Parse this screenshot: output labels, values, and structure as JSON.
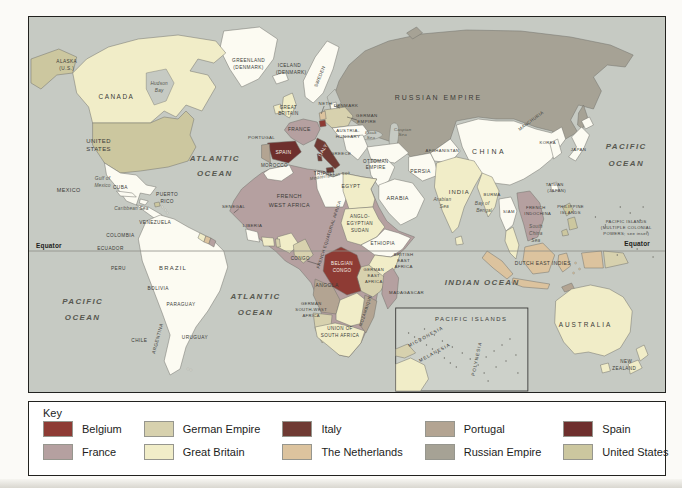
{
  "colors": {
    "ocean": "#c6cac3",
    "land": "#fcfbf2",
    "gb": "#f1edc8",
    "fr": "#b5a0a0",
    "de": "#d7d1ae",
    "nl": "#dcc39e",
    "pt": "#b3a492",
    "ru": "#a6a295",
    "us": "#ccc79f",
    "be": "#8e3b34",
    "it": "#6f3a33",
    "es": "#6e2f2d",
    "inset_bg": "#cdd1ca"
  },
  "legend": {
    "title": "Key",
    "entries": [
      {
        "label": "Belgium",
        "color": "#8e3b34"
      },
      {
        "label": "France",
        "color": "#b5a0a0"
      },
      {
        "label": "German Empire",
        "color": "#d7d1ae"
      },
      {
        "label": "Great Britain",
        "color": "#f1edc8"
      },
      {
        "label": "Italy",
        "color": "#6f3a33"
      },
      {
        "label": "The Netherlands",
        "color": "#dcc39e"
      },
      {
        "label": "Portugal",
        "color": "#b3a492"
      },
      {
        "label": "Russian Empire",
        "color": "#a6a295"
      },
      {
        "label": "Spain",
        "color": "#6e2f2d"
      },
      {
        "label": "United States",
        "color": "#ccc79f"
      },
      {
        "label": "Other independent states",
        "color": "#ffffff"
      }
    ]
  },
  "map": {
    "labels": [
      {
        "t": "ALASKA",
        "x": 38,
        "y": 46,
        "c": "country",
        "s": 4.8
      },
      {
        "t": "(U.S.)",
        "x": 38,
        "y": 53,
        "c": "country",
        "s": 4.8
      },
      {
        "t": "CANADA",
        "x": 88,
        "y": 82,
        "c": "country",
        "s": 6.5,
        "ls": 1.5
      },
      {
        "t": "Hudson",
        "x": 131,
        "y": 68,
        "c": "sea"
      },
      {
        "t": "Bay",
        "x": 131,
        "y": 75,
        "c": "sea"
      },
      {
        "t": "GREENLAND",
        "x": 221,
        "y": 45,
        "c": "country",
        "s": 4.8
      },
      {
        "t": "(DENMARK)",
        "x": 221,
        "y": 52,
        "c": "country",
        "s": 4.8
      },
      {
        "t": "ICELAND",
        "x": 262,
        "y": 50,
        "c": "country",
        "s": 4.8
      },
      {
        "t": "(DENMARK)",
        "x": 264,
        "y": 57,
        "c": "country",
        "s": 4.8
      },
      {
        "t": "UNITED",
        "x": 70,
        "y": 126,
        "c": "country",
        "s": 6
      },
      {
        "t": "STATES",
        "x": 70,
        "y": 134,
        "c": "country",
        "s": 6
      },
      {
        "t": "Gulf of",
        "x": 74,
        "y": 163,
        "c": "sea"
      },
      {
        "t": "Mexico",
        "x": 74,
        "y": 170,
        "c": "sea"
      },
      {
        "t": "MEXICO",
        "x": 40,
        "y": 175,
        "c": "country"
      },
      {
        "t": "CUBA",
        "x": 92,
        "y": 172,
        "c": "country",
        "s": 4.8
      },
      {
        "t": "PUERTO",
        "x": 139,
        "y": 179,
        "c": "country",
        "s": 4.8
      },
      {
        "t": "RICO",
        "x": 139,
        "y": 186,
        "c": "country",
        "s": 4.8
      },
      {
        "t": "Caribbean Sea",
        "x": 103,
        "y": 193,
        "c": "sea"
      },
      {
        "t": "VENEZUELA",
        "x": 127,
        "y": 207,
        "c": "country",
        "s": 4.8
      },
      {
        "t": "COLOMBIA",
        "x": 92,
        "y": 220,
        "c": "country",
        "s": 4.8
      },
      {
        "t": "ECUADOR",
        "x": 82,
        "y": 233,
        "c": "country",
        "s": 4.8
      },
      {
        "t": "PERU",
        "x": 90,
        "y": 253,
        "c": "country",
        "s": 4.8
      },
      {
        "t": "BRAZIL",
        "x": 145,
        "y": 253,
        "c": "country",
        "s": 6,
        "ls": 1.2
      },
      {
        "t": "BOLIVIA",
        "x": 130,
        "y": 273,
        "c": "country",
        "s": 4.8
      },
      {
        "t": "PARAGUAY",
        "x": 153,
        "y": 289,
        "c": "country",
        "s": 4.8
      },
      {
        "t": "ARGENTINA",
        "x": 131,
        "y": 322,
        "c": "country",
        "s": 4.8,
        "r": -75
      },
      {
        "t": "CHILE",
        "x": 111,
        "y": 325,
        "c": "country",
        "s": 4.8
      },
      {
        "t": "URUGUAY",
        "x": 167,
        "y": 322,
        "c": "country",
        "s": 4.8
      },
      {
        "t": "ATLANTIC",
        "x": 187,
        "y": 144,
        "c": "ocean"
      },
      {
        "t": "OCEAN",
        "x": 187,
        "y": 159,
        "c": "ocean"
      },
      {
        "t": "PACIFIC",
        "x": 54,
        "y": 287,
        "c": "ocean"
      },
      {
        "t": "OCEAN",
        "x": 54,
        "y": 303,
        "c": "ocean"
      },
      {
        "t": "ATLANTIC",
        "x": 228,
        "y": 282,
        "c": "ocean"
      },
      {
        "t": "OCEAN",
        "x": 228,
        "y": 298,
        "c": "ocean"
      },
      {
        "t": "INDIAN OCEAN",
        "x": 456,
        "y": 268,
        "c": "ocean"
      },
      {
        "t": "PACIFIC",
        "x": 601,
        "y": 132,
        "c": "ocean"
      },
      {
        "t": "OCEAN",
        "x": 601,
        "y": 149,
        "c": "ocean"
      },
      {
        "t": "SWEDEN",
        "x": 294,
        "y": 60,
        "c": "country",
        "s": 4.6,
        "r": -68
      },
      {
        "t": "NETH.",
        "x": 299,
        "y": 88,
        "c": "country",
        "s": 4.4
      },
      {
        "t": "DENMARK",
        "x": 319,
        "y": 90,
        "c": "country",
        "s": 4.4
      },
      {
        "t": "GREAT",
        "x": 261,
        "y": 92,
        "c": "country",
        "s": 4.6
      },
      {
        "t": "BRITAIN",
        "x": 261,
        "y": 98,
        "c": "country",
        "s": 4.6
      },
      {
        "t": "FRANCE",
        "x": 272,
        "y": 114,
        "c": "country",
        "s": 5
      },
      {
        "t": "GERMAN",
        "x": 340,
        "y": 100,
        "c": "country",
        "s": 4.4
      },
      {
        "t": "EMPIRE",
        "x": 340,
        "y": 106,
        "c": "country",
        "s": 4.4
      },
      {
        "t": "AUSTRIA-",
        "x": 321,
        "y": 115,
        "c": "country",
        "s": 4.4
      },
      {
        "t": "HUNGARY",
        "x": 321,
        "y": 121,
        "c": "country",
        "s": 4.4
      },
      {
        "t": "PORTUGAL",
        "x": 234,
        "y": 122,
        "c": "country",
        "s": 4.4
      },
      {
        "t": "SPAIN",
        "x": 256,
        "y": 137,
        "c": "white",
        "s": 5
      },
      {
        "t": "ITALY",
        "x": 297,
        "y": 134,
        "c": "white",
        "s": 4.8,
        "r": -60
      },
      {
        "t": "GREECE",
        "x": 314,
        "y": 138,
        "c": "country",
        "s": 4.4
      },
      {
        "t": "OTTOMAN",
        "x": 349,
        "y": 146,
        "c": "country",
        "s": 4.6
      },
      {
        "t": "EMPIRE",
        "x": 349,
        "y": 152,
        "c": "country",
        "s": 4.6
      },
      {
        "t": "RUSSIAN EMPIRE",
        "x": 412,
        "y": 83,
        "c": "country",
        "s": 7,
        "ls": 2
      },
      {
        "t": "Black",
        "x": 344,
        "y": 117,
        "c": "sea",
        "s": 4.4
      },
      {
        "t": "Sea",
        "x": 344,
        "y": 122,
        "c": "sea",
        "s": 4.4
      },
      {
        "t": "Caspian",
        "x": 376,
        "y": 114,
        "c": "sea",
        "s": 4.4
      },
      {
        "t": "Sea",
        "x": 376,
        "y": 119,
        "c": "sea",
        "s": 4.4
      },
      {
        "t": "Mediterranean Sea",
        "x": 303,
        "y": 160,
        "c": "sea",
        "s": 4.4,
        "r": -9
      },
      {
        "t": "MOROCCO",
        "x": 247,
        "y": 150,
        "c": "country",
        "s": 4.6
      },
      {
        "t": "TRIPOLI",
        "x": 297,
        "y": 158,
        "c": "country",
        "s": 4.6
      },
      {
        "t": "EGYPT",
        "x": 324,
        "y": 171,
        "c": "country",
        "s": 5
      },
      {
        "t": "SENEGAL",
        "x": 206,
        "y": 191,
        "c": "country",
        "s": 4.4
      },
      {
        "t": "FRENCH",
        "x": 262,
        "y": 181,
        "c": "country",
        "s": 5.5
      },
      {
        "t": "WEST AFRICA",
        "x": 262,
        "y": 190,
        "c": "country",
        "s": 5.5
      },
      {
        "t": "LIBERIA",
        "x": 225,
        "y": 210,
        "c": "country",
        "s": 4.4
      },
      {
        "t": "FRENCH EQUATORIAL AFRICA",
        "x": 303,
        "y": 218,
        "c": "country",
        "s": 4.2,
        "r": -72
      },
      {
        "t": "ANGLO-",
        "x": 333,
        "y": 201,
        "c": "country",
        "s": 4.6
      },
      {
        "t": "EGYPTIAN",
        "x": 333,
        "y": 208,
        "c": "country",
        "s": 4.6
      },
      {
        "t": "SUDAN",
        "x": 333,
        "y": 215,
        "c": "country",
        "s": 4.6
      },
      {
        "t": "ETHIOPIA",
        "x": 356,
        "y": 228,
        "c": "country",
        "s": 4.6
      },
      {
        "t": "CONGO",
        "x": 273,
        "y": 243,
        "c": "country",
        "s": 4.6
      },
      {
        "t": "BELGIAN",
        "x": 315,
        "y": 248,
        "c": "white",
        "s": 4.6
      },
      {
        "t": "CONGO",
        "x": 315,
        "y": 255,
        "c": "white",
        "s": 4.6
      },
      {
        "t": "BRITISH",
        "x": 377,
        "y": 239,
        "c": "country",
        "s": 4.4
      },
      {
        "t": "EAST",
        "x": 377,
        "y": 245,
        "c": "country",
        "s": 4.4
      },
      {
        "t": "AFRICA",
        "x": 377,
        "y": 251,
        "c": "country",
        "s": 4.4
      },
      {
        "t": "GERMAN",
        "x": 347,
        "y": 254,
        "c": "country",
        "s": 4.2
      },
      {
        "t": "EAST",
        "x": 347,
        "y": 260,
        "c": "country",
        "s": 4.2
      },
      {
        "t": "AFRICA",
        "x": 347,
        "y": 266,
        "c": "country",
        "s": 4.2
      },
      {
        "t": "ANGOLA",
        "x": 300,
        "y": 270,
        "c": "country",
        "s": 5
      },
      {
        "t": "GERMAN",
        "x": 284,
        "y": 288,
        "c": "country",
        "s": 4.2
      },
      {
        "t": "SOUTH-WEST",
        "x": 284,
        "y": 294,
        "c": "country",
        "s": 4.2
      },
      {
        "t": "AFRICA",
        "x": 284,
        "y": 300,
        "c": "country",
        "s": 4.2
      },
      {
        "t": "MOZAMBIQUE",
        "x": 340,
        "y": 294,
        "c": "country",
        "s": 4.2,
        "r": -72
      },
      {
        "t": "MADAGASCAR",
        "x": 380,
        "y": 277,
        "c": "country",
        "s": 4.4
      },
      {
        "t": "UNION OF",
        "x": 313,
        "y": 313,
        "c": "country",
        "s": 4.6
      },
      {
        "t": "SOUTH AFRICA",
        "x": 313,
        "y": 320,
        "c": "country",
        "s": 4.6
      },
      {
        "t": "PERSIA",
        "x": 394,
        "y": 156,
        "c": "country",
        "s": 5
      },
      {
        "t": "ARABIA",
        "x": 371,
        "y": 183,
        "c": "country",
        "s": 5.5
      },
      {
        "t": "AFGHANISTAN",
        "x": 416,
        "y": 135,
        "c": "country",
        "s": 4.2
      },
      {
        "t": "Arabian",
        "x": 416,
        "y": 184,
        "c": "sea"
      },
      {
        "t": "Sea",
        "x": 418,
        "y": 191,
        "c": "sea"
      },
      {
        "t": "CHINA",
        "x": 463,
        "y": 137,
        "c": "country",
        "s": 7,
        "ls": 2.5
      },
      {
        "t": "INDIA",
        "x": 433,
        "y": 177,
        "c": "country",
        "s": 6,
        "ls": 1
      },
      {
        "t": "Bay of",
        "x": 456,
        "y": 188,
        "c": "sea"
      },
      {
        "t": "Bengal",
        "x": 458,
        "y": 195,
        "c": "sea"
      },
      {
        "t": "BURMA",
        "x": 466,
        "y": 179,
        "c": "country",
        "s": 4.2
      },
      {
        "t": "SIAM",
        "x": 483,
        "y": 196,
        "c": "country",
        "s": 4.2
      },
      {
        "t": "FRENCH",
        "x": 510,
        "y": 192,
        "c": "country",
        "s": 4.2
      },
      {
        "t": "INDOCHINA",
        "x": 512,
        "y": 198,
        "c": "country",
        "s": 4.2
      },
      {
        "t": "TAIWAN",
        "x": 529,
        "y": 169,
        "c": "country",
        "s": 4.2
      },
      {
        "t": "(JAPAN)",
        "x": 531,
        "y": 175,
        "c": "country",
        "s": 4.2
      },
      {
        "t": "KOREA",
        "x": 522,
        "y": 127,
        "c": "country",
        "s": 4.2
      },
      {
        "t": "JAPAN",
        "x": 553,
        "y": 134,
        "c": "country",
        "s": 4.4
      },
      {
        "t": "MANCHURIA",
        "x": 506,
        "y": 105,
        "c": "country",
        "s": 4.4,
        "r": -36
      },
      {
        "t": "PHILIPPINE",
        "x": 545,
        "y": 191,
        "c": "country",
        "s": 4.2
      },
      {
        "t": "ISLANDS",
        "x": 545,
        "y": 197,
        "c": "country",
        "s": 4.2
      },
      {
        "t": "South",
        "x": 510,
        "y": 211,
        "c": "sea"
      },
      {
        "t": "China",
        "x": 510,
        "y": 218,
        "c": "sea"
      },
      {
        "t": "Sea",
        "x": 510,
        "y": 225,
        "c": "sea"
      },
      {
        "t": "DUTCH EAST INDIES",
        "x": 517,
        "y": 248,
        "c": "country",
        "s": 5
      },
      {
        "t": "PACIFIC ISLANDS",
        "x": 601,
        "y": 206,
        "c": "country",
        "s": 4.2
      },
      {
        "t": "(MULTIPLE COLONIAL",
        "x": 601,
        "y": 212,
        "c": "country",
        "s": 4.2
      },
      {
        "t": "POWERS; see inset)",
        "x": 601,
        "y": 218,
        "c": "country",
        "s": 4.2
      },
      {
        "t": "AUSTRALIA",
        "x": 560,
        "y": 310,
        "c": "country",
        "s": 6.5,
        "ls": 2
      },
      {
        "t": "NEW",
        "x": 601,
        "y": 346,
        "c": "country",
        "s": 4.6
      },
      {
        "t": "ZEALAND",
        "x": 599,
        "y": 353,
        "c": "country",
        "s": 4.6
      },
      {
        "t": "Equator",
        "x": 20,
        "y": 231,
        "c": "bold",
        "a": "start"
      },
      {
        "t": "Equator",
        "x": 612,
        "y": 229,
        "c": "bold"
      },
      {
        "t": "PACIFIC ISLANDS",
        "x": 445,
        "y": 304,
        "c": "country",
        "s": 6,
        "ls": 1.5
      },
      {
        "t": "MICRONESIA",
        "x": 400,
        "y": 321,
        "c": "country",
        "s": 4.6,
        "ls": 1,
        "r": -28
      },
      {
        "t": "MELANESIA",
        "x": 409,
        "y": 337,
        "c": "country",
        "s": 4.6,
        "ls": 1,
        "r": -28
      },
      {
        "t": "POLYNESIA",
        "x": 452,
        "y": 342,
        "c": "country",
        "s": 4.6,
        "ls": 1,
        "r": -78
      }
    ]
  }
}
